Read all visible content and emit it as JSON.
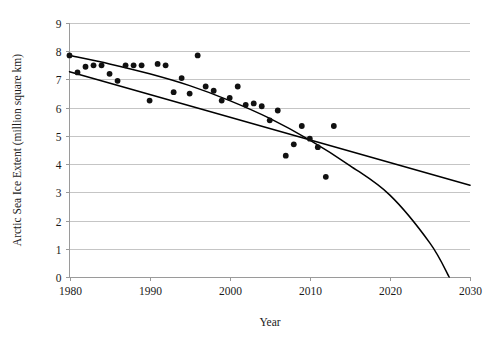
{
  "chart_data": {
    "type": "scatter",
    "title": "",
    "subtitle": "",
    "xlabel": "Year",
    "ylabel": "Arctic Sea Ice Extent (million square km)",
    "xlim": [
      1980,
      2030
    ],
    "ylim": [
      0,
      9
    ],
    "xticks": [
      1980,
      1990,
      2000,
      2010,
      2020,
      2030
    ],
    "yticks": [
      0,
      1,
      2,
      3,
      4,
      5,
      6,
      7,
      8,
      9
    ],
    "xtick_labels": [
      "1980",
      "1990",
      "2000",
      "2010",
      "2020",
      "2030"
    ],
    "ytick_labels": [
      "0",
      "1",
      "2",
      "3",
      "4",
      "5",
      "6",
      "7",
      "8",
      "9"
    ],
    "grid": "horizontal",
    "legend": "none",
    "marker": "filled-circle",
    "marker_color": "#111111",
    "series": [
      {
        "name": "Annual Arctic sea ice extent",
        "type": "scatter",
        "x": [
          1980,
          1981,
          1982,
          1983,
          1984,
          1985,
          1986,
          1987,
          1988,
          1989,
          1990,
          1991,
          1992,
          1993,
          1994,
          1995,
          1996,
          1997,
          1998,
          1999,
          2000,
          2001,
          2002,
          2003,
          2004,
          2005,
          2006,
          2007,
          2008,
          2009,
          2010,
          2011,
          2012,
          2013
        ],
        "y": [
          7.85,
          7.25,
          7.45,
          7.5,
          7.5,
          7.2,
          6.95,
          7.5,
          7.5,
          7.5,
          6.25,
          7.55,
          7.5,
          6.55,
          7.05,
          6.5,
          7.85,
          6.75,
          6.6,
          6.25,
          6.35,
          6.75,
          6.1,
          6.15,
          6.05,
          5.55,
          5.9,
          4.3,
          4.7,
          5.35,
          4.9,
          4.6,
          3.55,
          5.35
        ]
      },
      {
        "name": "Linear trend",
        "type": "line",
        "x": [
          1980,
          2030
        ],
        "y": [
          7.27,
          3.25
        ]
      },
      {
        "name": "Quadratic trend",
        "type": "line",
        "x": [
          1980,
          1985,
          1990,
          1995,
          2000,
          2005,
          2010,
          2015,
          2020,
          2025,
          2027.4
        ],
        "y": [
          7.85,
          7.55,
          7.2,
          6.78,
          6.25,
          5.62,
          4.85,
          3.95,
          2.9,
          1.2,
          0.0
        ]
      }
    ]
  }
}
